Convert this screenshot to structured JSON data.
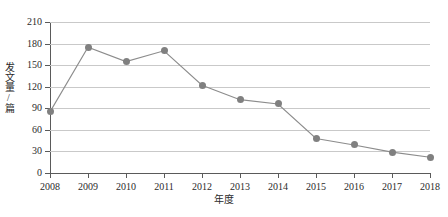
{
  "chart_data": {
    "type": "line",
    "title": "",
    "subtitle": "",
    "xlabel": "年度",
    "ylabel": "发文量/篇",
    "categories": [
      "2008",
      "2009",
      "2010",
      "2011",
      "2012",
      "2013",
      "2014",
      "2015",
      "2016",
      "2017",
      "2018"
    ],
    "values": [
      85,
      175,
      155,
      170,
      122,
      102,
      96,
      48,
      39,
      29,
      22
    ],
    "series": [
      {
        "name": "发文量",
        "values": [
          85,
          175,
          155,
          170,
          122,
          102,
          96,
          48,
          39,
          29,
          22
        ]
      }
    ],
    "ylim": [
      0,
      210
    ],
    "yticks": [
      0,
      30,
      60,
      90,
      120,
      150,
      180,
      210
    ],
    "ytick_labels": [
      "0",
      "30",
      "60",
      "90",
      "120",
      "150",
      "180",
      "210"
    ],
    "xtick_labels": [
      "2008",
      "2009",
      "2010",
      "2011",
      "2012",
      "2013",
      "2014",
      "2015",
      "2016",
      "2017",
      "2018"
    ],
    "grid": true,
    "grid_axis": "y",
    "legend": false,
    "legend_position": "none",
    "marker": "circle",
    "colors": {
      "line": "#8c8c8c",
      "marker": "#808080",
      "grid": "#c9c9c9",
      "axis": "#5a5a5a",
      "text": "#2b2b2b",
      "background": "#ffffff"
    }
  }
}
